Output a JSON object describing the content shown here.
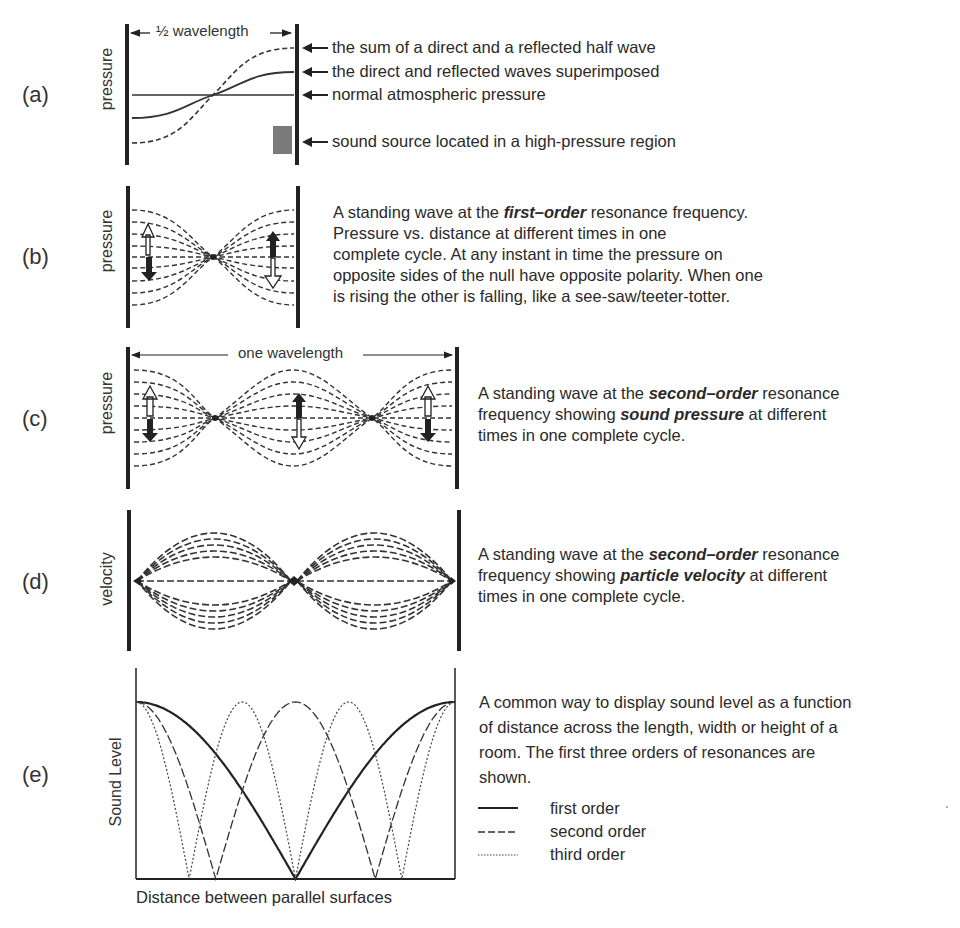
{
  "panels": {
    "a": {
      "label": "(a)",
      "ylabel": "pressure",
      "dimension": "½ wavelength",
      "callouts": [
        "the sum of a direct and a reflected half wave",
        "the direct and reflected waves superimposed",
        "normal atmospheric pressure",
        "sound source located in a high-pressure region"
      ]
    },
    "b": {
      "label": "(b)",
      "ylabel": "pressure",
      "note_lines": [
        {
          "pre": "A standing wave at the ",
          "em": "first–order",
          "post": " resonance frequency."
        },
        {
          "pre": "Pressure vs. distance at different times in one",
          "em": "",
          "post": ""
        },
        {
          "pre": "complete cycle. At any instant in time the pressure on",
          "em": "",
          "post": ""
        },
        {
          "pre": "opposite sides of the null have opposite polarity. When one",
          "em": "",
          "post": ""
        },
        {
          "pre": "is rising the other is falling, like a see-saw/teeter-totter.",
          "em": "",
          "post": ""
        }
      ]
    },
    "c": {
      "label": "(c)",
      "ylabel": "pressure",
      "dimension": "one wavelength",
      "note_lines": [
        {
          "pre": "A standing wave at the ",
          "em": "second–order",
          "post": " resonance"
        },
        {
          "pre": "frequency showing ",
          "em": "sound pressure",
          "post": " at different"
        },
        {
          "pre": "times in one complete cycle.",
          "em": "",
          "post": ""
        }
      ]
    },
    "d": {
      "label": "(d)",
      "ylabel": "velocity",
      "note_lines": [
        {
          "pre": "A standing wave at the ",
          "em": "second–order",
          "post": " resonance"
        },
        {
          "pre": "frequency showing ",
          "em": "particle velocity",
          "post": " at different"
        },
        {
          "pre": "times in one complete cycle.",
          "em": "",
          "post": ""
        }
      ]
    },
    "e": {
      "label": "(e)",
      "ylabel": "Sound Level",
      "xlabel": "Distance between parallel surfaces",
      "note_lines": [
        "A common way to display sound level as a function",
        "of distance across the length, width or height of a",
        "room. The first three orders of resonances are",
        "shown."
      ],
      "legend": [
        {
          "style": "solid",
          "label": "first order"
        },
        {
          "style": "dashed",
          "label": "second order"
        },
        {
          "style": "dotted",
          "label": "third order"
        }
      ]
    }
  },
  "colors": {
    "ink": "#222222",
    "text": "#2a2a2a",
    "source_box": "#7a7a7a",
    "background": "#ffffff"
  },
  "chart_data": {
    "type": "line",
    "xlabel": "Distance between parallel surfaces",
    "ylabel": "Sound Level",
    "x_range": [
      0,
      1
    ],
    "y_range": [
      0,
      1
    ],
    "grid": false,
    "legend_position": "right",
    "series": [
      {
        "name": "first order",
        "style": "solid",
        "formula": "|cos(pi*x)|",
        "nulls_at_x": [
          0.5
        ],
        "peaks_at_x": [
          0,
          1
        ]
      },
      {
        "name": "second order",
        "style": "dashed",
        "formula": "|cos(2*pi*x)|",
        "nulls_at_x": [
          0.25,
          0.75
        ],
        "peaks_at_x": [
          0,
          0.5,
          1
        ]
      },
      {
        "name": "third order",
        "style": "dotted",
        "formula": "|cos(3*pi*x)|",
        "nulls_at_x": [
          0.1667,
          0.5,
          0.8333
        ],
        "peaks_at_x": [
          0,
          0.3333,
          0.6667,
          1
        ]
      }
    ]
  }
}
